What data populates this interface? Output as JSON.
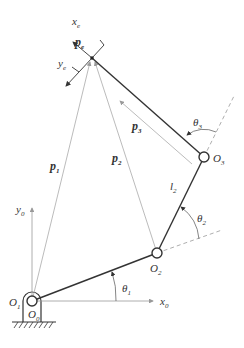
{
  "diagram": {
    "type": "robot-arm-kinematics",
    "colors": {
      "link": "#333333",
      "vector": "#aaaaaa",
      "dashed": "#999999",
      "text": "#333333",
      "background": "#ffffff"
    },
    "points": {
      "base": {
        "name": "O",
        "sub1": "1",
        "sub2": "0"
      },
      "O2": {
        "name": "O",
        "sub": "2"
      },
      "O3": {
        "name": "O",
        "sub": "3"
      },
      "end_effector": {
        "name": "p",
        "sub": "e"
      }
    },
    "axes": {
      "base_x": {
        "name": "x",
        "sub": "0"
      },
      "base_y": {
        "name": "y",
        "sub": "0"
      },
      "effector_x": {
        "name": "x",
        "sub": "e"
      },
      "effector_y": {
        "name": "y",
        "sub": "e"
      }
    },
    "vectors": {
      "p1": {
        "name": "p",
        "sub": "1"
      },
      "p2": {
        "name": "p",
        "sub": "2"
      },
      "p3": {
        "name": "p",
        "sub": "3"
      }
    },
    "links": {
      "l2": {
        "name": "l",
        "sub": "2"
      }
    },
    "angles": {
      "theta1": {
        "name": "θ",
        "sub": "1"
      },
      "theta2": {
        "name": "θ",
        "sub": "2"
      },
      "theta3": {
        "name": "θ",
        "sub": "3"
      }
    }
  }
}
